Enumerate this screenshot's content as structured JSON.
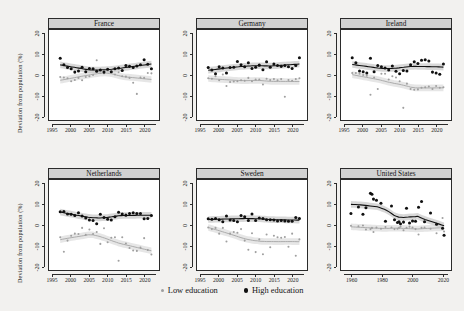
{
  "figure": {
    "ylabel": "Deviation from population (%)",
    "legend": {
      "position": "bottom",
      "items": [
        {
          "label": "Low education",
          "color": "#9e9e9e",
          "marker": "small-dot"
        },
        {
          "label": "High education",
          "color": "#101010",
          "marker": "large-dot"
        }
      ]
    }
  },
  "chart_data": {
    "type": "scatter",
    "title": "",
    "subtitle": "",
    "xlabel": "",
    "ylabel": "Deviation from population (%)",
    "ylim": [
      -20,
      20
    ],
    "yticks": [
      20,
      10,
      0,
      -10,
      -20
    ],
    "grid": false,
    "legend_position": "bottom",
    "legend": [
      "Low education",
      "High education"
    ],
    "series_colors": {
      "Low education": "#9e9e9e",
      "High education": "#101010"
    },
    "smoother": "loess with confidence band",
    "panels": [
      {
        "name": "France",
        "xlim": [
          1995,
          2023
        ],
        "xticks": [
          1995,
          2000,
          2005,
          2010,
          2015,
          2020
        ],
        "series": [
          {
            "name": "High education",
            "x": [
              1997,
              1998,
              1999,
              2000,
              2001,
              2002,
              2003,
              2004,
              2005,
              2006,
              2007,
              2008,
              2009,
              2010,
              2011,
              2012,
              2013,
              2014,
              2015,
              2016,
              2017,
              2018,
              2019,
              2020,
              2021,
              2022
            ],
            "y": [
              8.2,
              5.0,
              3.6,
              3.0,
              1.4,
              2.0,
              3.8,
              1.6,
              3.2,
              3.0,
              1.8,
              2.4,
              1.4,
              2.8,
              1.6,
              3.0,
              3.4,
              2.2,
              4.6,
              4.2,
              3.6,
              4.4,
              5.0,
              7.4,
              5.2,
              3.0
            ]
          },
          {
            "name": "Low education",
            "x": [
              1997,
              1998,
              1999,
              2000,
              2001,
              2002,
              2003,
              2004,
              2005,
              2006,
              2007,
              2008,
              2009,
              2010,
              2011,
              2012,
              2013,
              2014,
              2015,
              2016,
              2017,
              2018,
              2019,
              2020,
              2021,
              2022
            ],
            "y": [
              -1.0,
              -1.2,
              -1.6,
              -3.0,
              -2.4,
              -1.4,
              -2.6,
              -1.0,
              -0.6,
              0.0,
              7.2,
              1.0,
              0.8,
              2.0,
              1.4,
              0.2,
              1.4,
              -0.6,
              -0.8,
              -1.4,
              -3.8,
              -9.2,
              -1.2,
              -1.4,
              1.0,
              0.8
            ]
          }
        ]
      },
      {
        "name": "Germany",
        "xlim": [
          1995,
          2023
        ],
        "xticks": [
          1995,
          2000,
          2005,
          2010,
          2015,
          2020
        ],
        "series": [
          {
            "name": "High education",
            "x": [
              1997,
              1998,
              1999,
              2000,
              2001,
              2002,
              2003,
              2004,
              2005,
              2006,
              2007,
              2008,
              2009,
              2010,
              2011,
              2012,
              2013,
              2014,
              2015,
              2016,
              2017,
              2018,
              2019,
              2020,
              2021,
              2022
            ],
            "y": [
              3.6,
              2.4,
              0.6,
              4.0,
              3.4,
              1.0,
              3.6,
              3.8,
              6.6,
              5.0,
              4.0,
              6.0,
              3.2,
              3.8,
              4.8,
              2.6,
              6.4,
              3.8,
              5.4,
              4.6,
              4.2,
              4.6,
              4.0,
              3.2,
              4.6,
              8.4
            ]
          },
          {
            "name": "Low education",
            "x": [
              1997,
              1998,
              1999,
              2000,
              2001,
              2002,
              2003,
              2004,
              2005,
              2006,
              2007,
              2008,
              2009,
              2010,
              2011,
              2012,
              2013,
              2014,
              2015,
              2016,
              2017,
              2018,
              2019,
              2020,
              2021,
              2022
            ],
            "y": [
              -1.6,
              -1.8,
              -0.6,
              -2.6,
              0.2,
              -5.4,
              -3.4,
              -3.2,
              -3.0,
              -2.6,
              -2.8,
              -1.4,
              -3.0,
              -2.2,
              -2.2,
              -4.6,
              -1.8,
              -2.4,
              -2.0,
              -2.6,
              -2.0,
              -10.6,
              -2.4,
              -2.8,
              -2.0,
              -1.6
            ]
          }
        ]
      },
      {
        "name": "Ireland",
        "xlim": [
          1995,
          2023
        ],
        "xticks": [
          1995,
          2000,
          2005,
          2010,
          2015,
          2020
        ],
        "series": [
          {
            "name": "High education",
            "x": [
              1997,
              1998,
              1999,
              2000,
              2001,
              2002,
              2003,
              2004,
              2005,
              2006,
              2007,
              2008,
              2009,
              2010,
              2011,
              2012,
              2013,
              2014,
              2015,
              2016,
              2017,
              2018,
              2019,
              2020,
              2021,
              2022
            ],
            "y": [
              8.4,
              6.0,
              2.0,
              1.6,
              1.0,
              8.2,
              1.6,
              4.6,
              4.0,
              3.4,
              2.4,
              4.4,
              1.8,
              0.6,
              2.2,
              2.0,
              5.0,
              6.4,
              5.6,
              7.2,
              7.4,
              6.8,
              1.4,
              1.0,
              0.4,
              5.4
            ]
          },
          {
            "name": "Low education",
            "x": [
              1997,
              1998,
              1999,
              2000,
              2001,
              2002,
              2003,
              2004,
              2005,
              2006,
              2007,
              2008,
              2009,
              2010,
              2011,
              2012,
              2013,
              2014,
              2015,
              2016,
              2017,
              2018,
              2019,
              2020,
              2021,
              2022
            ],
            "y": [
              1.0,
              1.0,
              0.6,
              0.0,
              -0.4,
              -9.6,
              -1.2,
              -6.8,
              0.6,
              0.6,
              -2.2,
              -0.6,
              -1.2,
              -3.0,
              -16.0,
              -4.2,
              -6.8,
              -7.2,
              -7.0,
              -6.2,
              -6.0,
              -5.6,
              -6.8,
              -5.4,
              -6.2,
              -6.0
            ]
          }
        ]
      },
      {
        "name": "Netherlands",
        "xlim": [
          1995,
          2023
        ],
        "xticks": [
          1995,
          2000,
          2005,
          2010,
          2015,
          2020
        ],
        "series": [
          {
            "name": "High education",
            "x": [
              1997,
              1998,
              1999,
              2000,
              2001,
              2002,
              2003,
              2004,
              2005,
              2006,
              2007,
              2008,
              2009,
              2010,
              2011,
              2012,
              2013,
              2014,
              2015,
              2016,
              2017,
              2018,
              2019,
              2020,
              2021,
              2022
            ],
            "y": [
              6.4,
              6.6,
              5.4,
              5.2,
              4.6,
              6.0,
              4.4,
              3.4,
              2.4,
              2.2,
              0.6,
              5.2,
              3.6,
              2.8,
              2.4,
              4.0,
              6.2,
              5.4,
              4.8,
              5.6,
              6.0,
              5.6,
              5.6,
              3.0,
              3.2,
              4.6
            ]
          },
          {
            "name": "Low education",
            "x": [
              1997,
              1998,
              1999,
              2000,
              2001,
              2002,
              2003,
              2004,
              2005,
              2006,
              2007,
              2008,
              2009,
              2010,
              2011,
              2012,
              2013,
              2014,
              2015,
              2016,
              2017,
              2018,
              2019,
              2020,
              2021,
              2022
            ],
            "y": [
              -6.0,
              -13.0,
              -7.6,
              -5.2,
              -4.2,
              -4.4,
              -1.4,
              -4.8,
              -2.2,
              -4.4,
              -3.4,
              -9.2,
              -1.6,
              -8.4,
              -6.2,
              -6.0,
              -17.4,
              -6.0,
              -9.0,
              -11.2,
              -12.4,
              -12.6,
              -11.0,
              -6.4,
              -12.2,
              -14.4
            ]
          }
        ]
      },
      {
        "name": "Sweden",
        "xlim": [
          1995,
          2023
        ],
        "xticks": [
          1995,
          2000,
          2005,
          2010,
          2015,
          2020
        ],
        "series": [
          {
            "name": "High education",
            "x": [
              1997,
              1998,
              1999,
              2000,
              2001,
              2002,
              2003,
              2004,
              2005,
              2006,
              2007,
              2008,
              2009,
              2010,
              2011,
              2012,
              2013,
              2014,
              2015,
              2016,
              2017,
              2018,
              2019,
              2020,
              2021,
              2022
            ],
            "y": [
              3.0,
              2.8,
              3.2,
              2.6,
              1.6,
              4.4,
              2.4,
              2.2,
              1.6,
              4.6,
              4.0,
              2.2,
              5.4,
              2.2,
              3.4,
              3.2,
              2.6,
              2.6,
              2.4,
              2.0,
              2.2,
              2.0,
              1.8,
              1.8,
              3.6,
              3.2
            ]
          },
          {
            "name": "Low education",
            "x": [
              1997,
              1998,
              1999,
              2000,
              2001,
              2002,
              2003,
              2004,
              2005,
              2006,
              2007,
              2008,
              2009,
              2010,
              2011,
              2012,
              2013,
              2014,
              2015,
              2016,
              2017,
              2018,
              2019,
              2020,
              2021,
              2022
            ],
            "y": [
              -1.2,
              -2.0,
              -1.4,
              -4.2,
              -1.4,
              -8.0,
              -4.2,
              -3.4,
              -3.8,
              -2.0,
              -7.6,
              -12.0,
              -4.0,
              -13.2,
              -7.0,
              -14.2,
              -4.6,
              -10.8,
              -5.2,
              -6.0,
              -6.2,
              -5.8,
              -10.6,
              -4.2,
              -15.0,
              -7.0
            ]
          }
        ]
      },
      {
        "name": "United States",
        "xlim": [
          1955,
          2023
        ],
        "xticks": [
          1960,
          1980,
          2000,
          2020
        ],
        "series": [
          {
            "name": "High education",
            "x": [
              1959,
              1964,
              1967,
              1969,
              1972,
              1973,
              1974,
              1976,
              1979,
              1982,
              1986,
              1988,
              1990,
              1991,
              1992,
              1994,
              1996,
              1998,
              2000,
              2002,
              2004,
              2006,
              2008,
              2012,
              2016,
              2020,
              2021
            ],
            "y": [
              5.6,
              8.8,
              5.2,
              8.4,
              15.4,
              15.0,
              12.6,
              12.0,
              10.6,
              1.8,
              9.2,
              2.6,
              1.2,
              1.6,
              0.6,
              1.4,
              8.2,
              1.0,
              2.0,
              1.8,
              8.6,
              11.4,
              1.6,
              5.8,
              0.4,
              -1.6,
              -5.0
            ]
          },
          {
            "name": "Low education",
            "x": [
              1959,
              1964,
              1967,
              1969,
              1972,
              1973,
              1974,
              1976,
              1979,
              1982,
              1986,
              1988,
              1990,
              1991,
              1992,
              1994,
              1996,
              1998,
              2000,
              2002,
              2004,
              2006,
              2008,
              2012,
              2016,
              2020,
              2021
            ],
            "y": [
              -0.4,
              -0.6,
              -0.2,
              -2.2,
              -2.0,
              -1.4,
              -3.4,
              -1.2,
              -1.8,
              -1.0,
              -1.2,
              -2.0,
              -1.8,
              -1.4,
              -0.8,
              -2.6,
              -1.4,
              -0.8,
              -1.2,
              -2.0,
              -4.6,
              -1.4,
              -1.2,
              -1.8,
              -4.0,
              3.4,
              -3.2
            ]
          }
        ]
      }
    ]
  }
}
